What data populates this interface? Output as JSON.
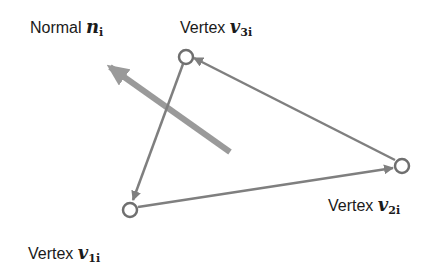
{
  "labels": {
    "normal": {
      "text": "Normal",
      "symbol": "n",
      "subscript": "i"
    },
    "vertex3": {
      "text": "Vertex",
      "symbol": "v",
      "subscript": "3i"
    },
    "vertex2": {
      "text": "Vertex",
      "symbol": "v",
      "subscript": "2i"
    },
    "vertex1": {
      "text": "Vertex",
      "symbol": "v",
      "subscript": "1i"
    }
  },
  "colors": {
    "line": "#888888",
    "normal_arrow": "#999999",
    "text": "#1a1a1a"
  },
  "vertices": [
    {
      "id": "v1i",
      "x": 130,
      "y": 210
    },
    {
      "id": "v2i",
      "x": 402,
      "y": 166
    },
    {
      "id": "v3i",
      "x": 186,
      "y": 57
    }
  ],
  "edges": [
    {
      "from": "v3i",
      "to": "v1i"
    },
    {
      "from": "v1i",
      "to": "v2i"
    },
    {
      "from": "v2i",
      "to": "v3i"
    }
  ],
  "normal_arrow": {
    "from": [
      230,
      152
    ],
    "to": [
      105,
      63
    ]
  }
}
